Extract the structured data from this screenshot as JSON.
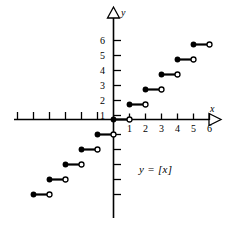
{
  "figure": {
    "title": "",
    "equation_label": "y = [x]",
    "axis_x_name": "x",
    "axis_y_name": "y",
    "ink_color": "#000000",
    "background_color": "#ffffff"
  },
  "chart_data": {
    "type": "line",
    "title": "",
    "subtitle": "",
    "xlabel": "x",
    "ylabel": "y",
    "annotations": [
      "y = [x]"
    ],
    "legend": [],
    "legend_position": "none",
    "grid": false,
    "xlim": [
      -7,
      6.8
    ],
    "ylim": [
      -5.6,
      6.8
    ],
    "xticks": [
      -6,
      -5,
      -4,
      -3,
      -2,
      -1,
      1,
      2,
      3,
      4,
      5,
      6
    ],
    "xtick_labels": [
      "",
      "",
      "",
      "",
      "",
      "",
      "1",
      "2",
      "3",
      "4",
      "5",
      "6"
    ],
    "yticks": [
      -5,
      -4,
      -3,
      -2,
      -1,
      1,
      2,
      3,
      4,
      5,
      6
    ],
    "ytick_labels": [
      "",
      "",
      "",
      "",
      "",
      "1",
      "2",
      "3",
      "4",
      "5",
      "6"
    ],
    "steps": [
      {
        "x_start": -5,
        "x_end": -4,
        "y": -5,
        "closed_left": true,
        "open_right": true
      },
      {
        "x_start": -4,
        "x_end": -3,
        "y": -4,
        "closed_left": true,
        "open_right": true
      },
      {
        "x_start": -3,
        "x_end": -2,
        "y": -3,
        "closed_left": true,
        "open_right": true
      },
      {
        "x_start": -2,
        "x_end": -1,
        "y": -2,
        "closed_left": true,
        "open_right": true
      },
      {
        "x_start": -1,
        "x_end": 0,
        "y": -1,
        "closed_left": true,
        "open_right": true
      },
      {
        "x_start": 0,
        "x_end": 1,
        "y": 0,
        "closed_left": true,
        "open_right": true
      },
      {
        "x_start": 1,
        "x_end": 2,
        "y": 1,
        "closed_left": true,
        "open_right": true
      },
      {
        "x_start": 2,
        "x_end": 3,
        "y": 2,
        "closed_left": true,
        "open_right": true
      },
      {
        "x_start": 3,
        "x_end": 4,
        "y": 3,
        "closed_left": true,
        "open_right": true
      },
      {
        "x_start": 4,
        "x_end": 5,
        "y": 4,
        "closed_left": true,
        "open_right": true
      },
      {
        "x_start": 5,
        "x_end": 6,
        "y": 5,
        "closed_left": true,
        "open_right": true
      }
    ]
  },
  "axis_labels": {
    "y": [
      {
        "text": "6",
        "left": 100,
        "top": 37
      },
      {
        "text": "5",
        "left": 100,
        "top": 52
      },
      {
        "text": "4",
        "left": 100,
        "top": 67
      },
      {
        "text": "3",
        "left": 100,
        "top": 82
      },
      {
        "text": "2",
        "left": 100,
        "top": 97
      },
      {
        "text": "1",
        "left": 100,
        "top": 112
      }
    ],
    "x": [
      {
        "text": "1",
        "left": 125,
        "top": 125
      },
      {
        "text": "2",
        "left": 141,
        "top": 125
      },
      {
        "text": "3",
        "left": 157,
        "top": 125
      },
      {
        "text": "4",
        "left": 173,
        "top": 125
      },
      {
        "text": "5",
        "left": 189,
        "top": 125
      },
      {
        "text": "6",
        "left": 205,
        "top": 125
      }
    ]
  }
}
